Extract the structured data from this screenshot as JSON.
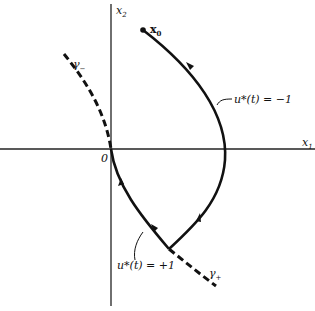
{
  "figure": {
    "type": "phase-plane switching diagram",
    "axes": {
      "x_label": "x",
      "x_sub": "1",
      "y_label": "x",
      "y_sub": "2",
      "origin_label": "0"
    },
    "points": {
      "initial_state": {
        "label": "x",
        "sub": "0"
      }
    },
    "curves": {
      "gamma_minus": {
        "label": "γ",
        "sub": "−",
        "style": "dashed"
      },
      "gamma_plus": {
        "label": "γ",
        "sub": "+",
        "style": "dashed"
      },
      "trajectory_minus": {
        "label": "u*(t) = −1",
        "style": "solid"
      },
      "trajectory_plus": {
        "label": "u*(t) = +1",
        "style": "solid"
      }
    },
    "colors": {
      "ink": "#111111",
      "background": "#ffffff"
    }
  }
}
